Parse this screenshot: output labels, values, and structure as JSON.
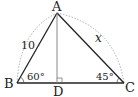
{
  "diagram": {
    "type": "triangle",
    "points": {
      "A": {
        "label": "A",
        "x": 57,
        "y": 13
      },
      "B": {
        "label": "B",
        "x": 17,
        "y": 83
      },
      "C": {
        "label": "C",
        "x": 124,
        "y": 83
      },
      "D": {
        "label": "D",
        "x": 57,
        "y": 83
      }
    },
    "side_labels": {
      "AB": "10",
      "AC": "x"
    },
    "angle_labels": {
      "B": "60°",
      "C": "45°"
    },
    "altitude": "AD",
    "right_angle_at": "D",
    "colors": {
      "line": "#222222",
      "altitude": "#888888",
      "arc": "#999999"
    }
  }
}
